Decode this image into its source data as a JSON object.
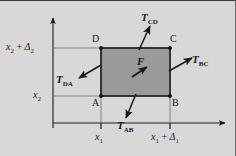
{
  "figure": {
    "background_color": "#d8d8d8",
    "element_fill_color": "#9a9a9a",
    "line_color": "#1a1a1a",
    "axes": {
      "x_axis_name": "horizontal-axis",
      "y_axis_name": "vertical-axis",
      "x_ticks": [
        {
          "label_text": "x",
          "label_sub": "1",
          "label_tail": ""
        },
        {
          "label_text": "x",
          "label_sub": "1",
          "label_tail": " + Δ"
        }
      ],
      "y_ticks": [
        {
          "label_text": "x",
          "label_sub": "2",
          "label_tail": ""
        },
        {
          "label_text": "x",
          "label_sub": "2",
          "label_tail": " + Δ"
        }
      ]
    },
    "labels": {
      "x1": "x",
      "x1_sub": "1",
      "x1_delta_lead": "x",
      "x1_delta_sub": "1",
      "x1_delta_plus": "+",
      "x1_delta_sym": "Δ",
      "x1_delta_sym_sub": "1",
      "x2": "x",
      "x2_sub": "2",
      "x2_delta_lead": "x",
      "x2_delta_sub": "2",
      "x2_delta_plus": "+",
      "x2_delta_sym": "Δ",
      "x2_delta_sym_sub": "2"
    },
    "corners": [
      {
        "name": "corner-a",
        "label": "A"
      },
      {
        "name": "corner-b",
        "label": "B"
      },
      {
        "name": "corner-c",
        "label": "C"
      },
      {
        "name": "corner-d",
        "label": "D"
      }
    ],
    "tractions": [
      {
        "name": "traction-cd",
        "symbol": "T",
        "subscript": "CD",
        "edge": "top",
        "direction": "outward up-right"
      },
      {
        "name": "traction-bc",
        "symbol": "T",
        "subscript": "BC",
        "edge": "right",
        "direction": "outward up-right"
      },
      {
        "name": "traction-ab",
        "symbol": "T",
        "subscript": "AB",
        "edge": "bottom",
        "direction": "outward down-left"
      },
      {
        "name": "traction-da",
        "symbol": "T",
        "subscript": "DA",
        "edge": "left",
        "direction": "outward down-left"
      }
    ],
    "body_force": {
      "name": "body-force",
      "symbol": "F",
      "direction": "up-right"
    }
  }
}
